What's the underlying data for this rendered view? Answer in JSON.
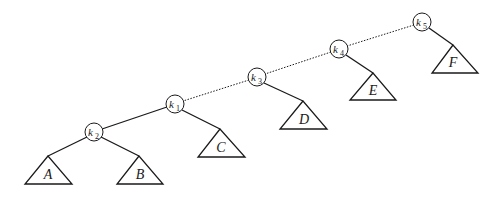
{
  "diagram": {
    "type": "binary-tree",
    "nodes": [
      {
        "id": "k5",
        "base": "k",
        "sub": "5"
      },
      {
        "id": "k4",
        "base": "k",
        "sub": "4"
      },
      {
        "id": "k3",
        "base": "k",
        "sub": "3"
      },
      {
        "id": "k1",
        "base": "k",
        "sub": "1"
      },
      {
        "id": "k2",
        "base": "k",
        "sub": "2"
      }
    ],
    "subtrees": [
      {
        "id": "A",
        "label": "A"
      },
      {
        "id": "B",
        "label": "B"
      },
      {
        "id": "C",
        "label": "C"
      },
      {
        "id": "D",
        "label": "D"
      },
      {
        "id": "E",
        "label": "E"
      },
      {
        "id": "F",
        "label": "F"
      }
    ],
    "edges": [
      {
        "from": "k5",
        "to": "k4",
        "style": "dotted"
      },
      {
        "from": "k4",
        "to": "k3",
        "style": "dotted"
      },
      {
        "from": "k3",
        "to": "k1",
        "style": "dotted"
      },
      {
        "from": "k1",
        "to": "k2",
        "style": "solid"
      },
      {
        "from": "k2",
        "to": "A",
        "style": "solid"
      },
      {
        "from": "k2",
        "to": "B",
        "style": "solid"
      },
      {
        "from": "k1",
        "to": "C",
        "style": "solid"
      },
      {
        "from": "k3",
        "to": "D",
        "style": "solid"
      },
      {
        "from": "k4",
        "to": "E",
        "style": "solid"
      },
      {
        "from": "k5",
        "to": "F",
        "style": "solid"
      }
    ]
  }
}
